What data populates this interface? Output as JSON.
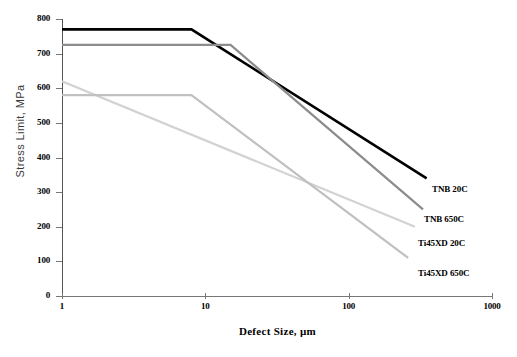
{
  "chart_data": {
    "type": "line",
    "title": "",
    "xlabel": "Defect Size,  µm",
    "ylabel": "Stress Limit, MPa",
    "xscale": "log",
    "xlim": [
      1,
      1000
    ],
    "ylim": [
      0,
      800
    ],
    "xticks": [
      1,
      10,
      100,
      1000
    ],
    "xtick_labels": [
      "1",
      "10",
      "100",
      "1000"
    ],
    "yticks": [
      0,
      100,
      200,
      300,
      400,
      500,
      600,
      700,
      800
    ],
    "ytick_labels": [
      "0",
      "100",
      "200",
      "300",
      "400",
      "500",
      "600",
      "700",
      "800"
    ],
    "grid": false,
    "legend_position": "right-inline-annotations",
    "series": [
      {
        "name": "TNB 20C",
        "color": "#000000",
        "width": 2.6,
        "x": [
          1,
          8,
          350
        ],
        "y": [
          770,
          770,
          340
        ]
      },
      {
        "name": "TNB 650C",
        "color": "#8c8c8c",
        "width": 2.2,
        "x": [
          1,
          15,
          330
        ],
        "y": [
          725,
          725,
          250
        ]
      },
      {
        "name": "Ti45XD 20C",
        "color": "#d2d2d2",
        "width": 2.2,
        "x": [
          1,
          290
        ],
        "y": [
          620,
          200
        ]
      },
      {
        "name": "Ti45XD 650C",
        "color": "#c0c0c0",
        "width": 2.2,
        "x": [
          1,
          8,
          260
        ],
        "y": [
          580,
          580,
          110
        ]
      }
    ],
    "annotations": [
      {
        "text": "TNB 20C",
        "x_px": 432,
        "y_px": 184
      },
      {
        "text": "TNB 650C",
        "x_px": 424,
        "y_px": 214
      },
      {
        "text": "Ti45XD 20C",
        "x_px": 418,
        "y_px": 238
      },
      {
        "text": "Ti45XD 650C",
        "x_px": 418,
        "y_px": 268
      }
    ]
  },
  "axes": {
    "y_title": "Stress Limit, MPa",
    "x_title": "Defect Size,  µm"
  }
}
